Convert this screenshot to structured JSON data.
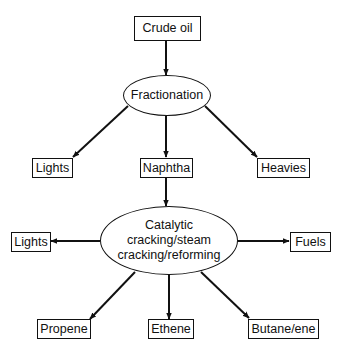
{
  "diagram": {
    "type": "flowchart",
    "colors": {
      "stroke": "#111111",
      "background": "#ffffff",
      "text": "#111111"
    },
    "nodes": {
      "crude_oil": {
        "label": "Crude oil",
        "shape": "rectangle"
      },
      "fractionation": {
        "label": "Fractionation",
        "shape": "ellipse"
      },
      "lights_1": {
        "label": "Lights",
        "shape": "rectangle"
      },
      "naphtha": {
        "label": "Naphtha",
        "shape": "rectangle"
      },
      "heavies": {
        "label": "Heavies",
        "shape": "rectangle"
      },
      "cracking": {
        "label": "Catalytic\ncracking/steam\ncracking/reforming",
        "shape": "ellipse"
      },
      "lights_2": {
        "label": "Lights",
        "shape": "rectangle"
      },
      "fuels": {
        "label": "Fuels",
        "shape": "rectangle"
      },
      "propene": {
        "label": "Propene",
        "shape": "rectangle"
      },
      "ethene": {
        "label": "Ethene",
        "shape": "rectangle"
      },
      "butane_ene": {
        "label": "Butane/ene",
        "shape": "rectangle"
      }
    },
    "edges": [
      {
        "from": "crude_oil",
        "to": "fractionation"
      },
      {
        "from": "fractionation",
        "to": "lights_1"
      },
      {
        "from": "fractionation",
        "to": "naphtha"
      },
      {
        "from": "fractionation",
        "to": "heavies"
      },
      {
        "from": "naphtha",
        "to": "cracking"
      },
      {
        "from": "cracking",
        "to": "lights_2"
      },
      {
        "from": "cracking",
        "to": "fuels"
      },
      {
        "from": "cracking",
        "to": "propene"
      },
      {
        "from": "cracking",
        "to": "ethene"
      },
      {
        "from": "cracking",
        "to": "butane_ene"
      }
    ]
  }
}
